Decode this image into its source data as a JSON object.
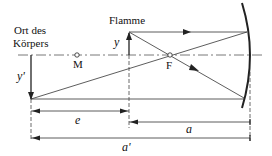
{
  "labels": {
    "object_location_line1": "Ort des",
    "object_location_line2": "Körpers",
    "flame": "Flamme",
    "object_height": "y",
    "image_height": "y'",
    "center_point": "M",
    "focal_point": "F",
    "dim_e": "e",
    "dim_a": "a",
    "dim_a_prime": "a'"
  },
  "colors": {
    "line": "#333333",
    "mirror": "#222222"
  }
}
